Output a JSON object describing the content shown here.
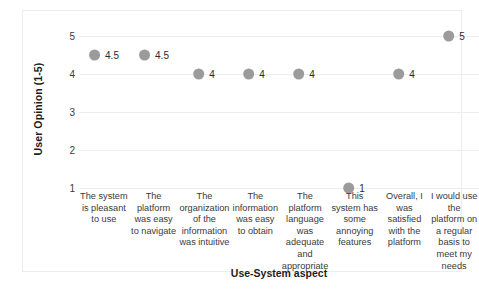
{
  "chart_data": {
    "type": "scatter",
    "title": "",
    "xlabel": "Use-System aspect",
    "ylabel": "User Opinion (1-5)",
    "ylim": [
      1,
      5
    ],
    "yticks": [
      1,
      2,
      3,
      4,
      5
    ],
    "ytick_labels": [
      "1",
      "2",
      "3",
      "4",
      "5"
    ],
    "grid": true,
    "legend": "none",
    "marker_color": "#9b9b9b",
    "gridline_color": "#ededee",
    "border_color": "#eceded",
    "categories": [
      "The system is pleasant to use",
      "The platform was easy to navigate",
      "The organization of the information was intuitive",
      "The information was easy to obtain",
      "The platform language was adequate and appropriate",
      "This system has some annoying features",
      "Overall, I was satisfied with the platform",
      "I would use the platform on a regular basis to meet my needs"
    ],
    "values": [
      4.5,
      4.5,
      4,
      4,
      4,
      1,
      4,
      5
    ],
    "data_labels": [
      "4.5",
      "4.5",
      "4",
      "4",
      "4",
      "1",
      "4",
      "5"
    ]
  },
  "caption": {
    "text": ""
  }
}
